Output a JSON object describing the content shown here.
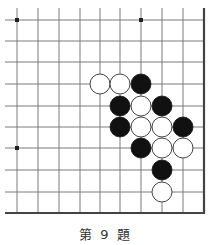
{
  "caption": "第 9 題",
  "board": {
    "columns_x": [
      17,
      38,
      59,
      80,
      100,
      120,
      141,
      162,
      183
    ],
    "rows_y": [
      20,
      41,
      62,
      84,
      106,
      127,
      148,
      170,
      192
    ],
    "right_edge_x": 204,
    "bottom_edge_y": 213,
    "top_open_y": 8,
    "left_open_x": 5,
    "line_color": "#7a7a7a",
    "edge_color": "#444444",
    "stone_radius": 10,
    "star_points": [
      [
        0,
        0
      ],
      [
        6,
        0
      ],
      [
        0,
        6
      ]
    ],
    "stones": [
      {
        "color": "white",
        "col": 4,
        "row": 3
      },
      {
        "color": "white",
        "col": 5,
        "row": 3
      },
      {
        "color": "black",
        "col": 6,
        "row": 3
      },
      {
        "color": "black",
        "col": 5,
        "row": 4
      },
      {
        "color": "white",
        "col": 6,
        "row": 4
      },
      {
        "color": "black",
        "col": 7,
        "row": 4
      },
      {
        "color": "black",
        "col": 5,
        "row": 5
      },
      {
        "color": "white",
        "col": 6,
        "row": 5
      },
      {
        "color": "white",
        "col": 7,
        "row": 5
      },
      {
        "color": "black",
        "col": 8,
        "row": 5
      },
      {
        "color": "black",
        "col": 6,
        "row": 6
      },
      {
        "color": "white",
        "col": 7,
        "row": 6
      },
      {
        "color": "white",
        "col": 8,
        "row": 6
      },
      {
        "color": "black",
        "col": 7,
        "row": 7
      },
      {
        "color": "white",
        "col": 7,
        "row": 8
      }
    ]
  }
}
